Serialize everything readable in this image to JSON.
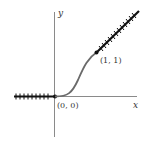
{
  "diagram": {
    "type": "function-graph",
    "axes": {
      "x_label": "x",
      "y_label": "y"
    },
    "points": [
      {
        "label": "(0, 0)",
        "x": 0,
        "y": 0
      },
      {
        "label": "(1, 1)",
        "x": 1,
        "y": 1
      }
    ],
    "segments": [
      {
        "name": "left-ray",
        "description": "y = 0 for x < 0",
        "style": "hatched-thick"
      },
      {
        "name": "s-curve",
        "description": "smooth transition from (0,0) to (1,1)",
        "style": "gray-curve"
      },
      {
        "name": "right-ray",
        "description": "y = x for x > 1",
        "style": "hatched-thick"
      }
    ],
    "colors": {
      "axis": "#888888",
      "ray": "#111111",
      "curve": "#666666",
      "text": "#333333"
    }
  }
}
